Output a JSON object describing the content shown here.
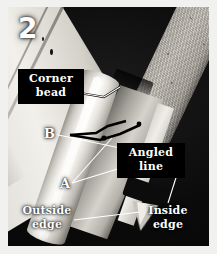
{
  "figure": {
    "number": "2",
    "caption_absent": true
  },
  "colors": {
    "page_background": "#f1f1ef",
    "photo_background": "#070707",
    "label_text": "#ffffff",
    "callout_box": "#000000",
    "leader_line_white": "#ffffff",
    "leader_line_black": "#000000"
  },
  "annotations": {
    "corner_bead": {
      "label": "Corner\nbead",
      "style": "boxed-callout",
      "points_to": "bead-nose-upper"
    },
    "b_marker": {
      "label": "B",
      "style": "letter",
      "points_to": "bead-crimp-black-lines"
    },
    "a_marker": {
      "label": "A",
      "style": "letter",
      "points_to": "bead-flange-white-lines"
    },
    "angled_line": {
      "label": "Angled\nline",
      "style": "boxed-callout",
      "points_to": "bead-angled-reference"
    },
    "outside_edge": {
      "label": "Outside\nedge",
      "style": "plain",
      "points_to": "bead-bottom-point"
    },
    "inside_edge": {
      "label": "Inside\nedge",
      "style": "plain",
      "points_to": "bead-inner-return"
    }
  },
  "subject": {
    "description": "Drywall corner bead installed on a framed corner",
    "alt": "Close-up photograph of a metal corner bead on drywall showing the outside edge, inside edge and angled reference line"
  }
}
